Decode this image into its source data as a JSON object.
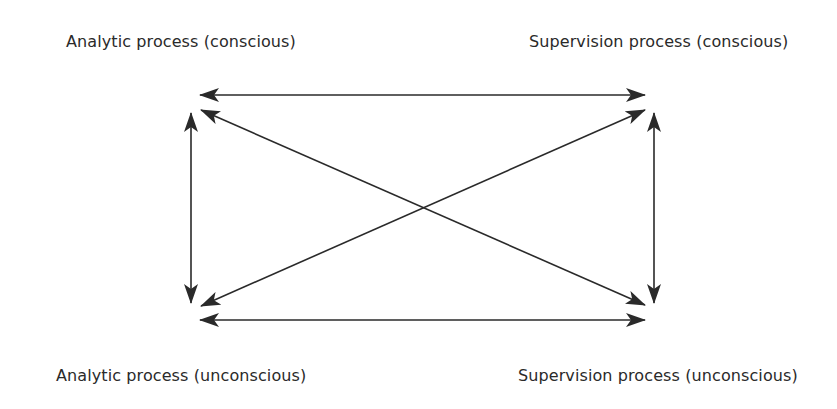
{
  "diagram": {
    "nodes": {
      "top_left": "Analytic process (conscious)",
      "top_right": "Supervision process (conscious)",
      "bottom_left": "Analytic process (unconscious)",
      "bottom_right": "Supervision process (unconscious)"
    },
    "edges": [
      {
        "from": "top_left",
        "to": "top_right",
        "type": "bidirectional"
      },
      {
        "from": "bottom_left",
        "to": "bottom_right",
        "type": "bidirectional"
      },
      {
        "from": "top_left",
        "to": "bottom_left",
        "type": "bidirectional"
      },
      {
        "from": "top_right",
        "to": "bottom_right",
        "type": "bidirectional"
      },
      {
        "from": "top_left",
        "to": "bottom_right",
        "type": "bidirectional"
      },
      {
        "from": "bottom_left",
        "to": "top_right",
        "type": "bidirectional"
      }
    ],
    "colors": {
      "line": "#2a2a2a",
      "background": "#ffffff"
    }
  }
}
